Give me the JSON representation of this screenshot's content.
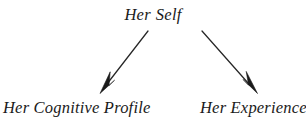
{
  "diagram": {
    "type": "tree",
    "background_color": "#ffffff",
    "text_color": "#1a1a1a",
    "edge_color": "#262626",
    "nodes": {
      "root": {
        "label": "Her Self",
        "label_word_1": "Her",
        "label_word_2": "Self",
        "x": 179,
        "y": 15
      },
      "left_child": {
        "label": "Her Cognitive Profile",
        "x": 71,
        "y": 109
      },
      "right_child": {
        "label": "Her Experiences",
        "x": 250,
        "y": 109
      }
    },
    "edges": [
      {
        "name": "root-to-left-child",
        "from": "root",
        "to": "left_child",
        "arrowhead": "filled-triangle",
        "start_x": 148,
        "start_y": 31,
        "end_x": 100,
        "end_y": 93
      },
      {
        "name": "root-to-right-child",
        "from": "root",
        "to": "right_child",
        "arrowhead": "filled-triangle",
        "start_x": 202,
        "start_y": 31,
        "end_x": 257,
        "end_y": 93
      }
    ]
  }
}
